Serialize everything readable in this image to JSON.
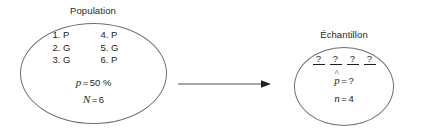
{
  "figure": {
    "population": {
      "caption": "Population",
      "items": [
        [
          "1. P",
          "4. P"
        ],
        [
          "2. G",
          "5. G"
        ],
        [
          "3. G",
          "6. P"
        ]
      ],
      "proportion": {
        "symbol": "p",
        "equals": "=",
        "value": "50 %"
      },
      "size": {
        "symbol": "N",
        "equals": "=",
        "value": "6"
      }
    },
    "sample": {
      "caption": "Échantillon",
      "unknowns": [
        "?",
        "?",
        "?",
        "?"
      ],
      "proportion": {
        "symbol": "p",
        "hat": "^",
        "equals": "=",
        "value": "?"
      },
      "size": {
        "symbol": "n",
        "equals": "=",
        "value": "4"
      }
    },
    "arrow": {
      "direction": "right",
      "color": "#3b3b3b"
    },
    "colors": {
      "background": "#ffffff",
      "text": "#231f20",
      "outline": "#6d6e71"
    }
  }
}
